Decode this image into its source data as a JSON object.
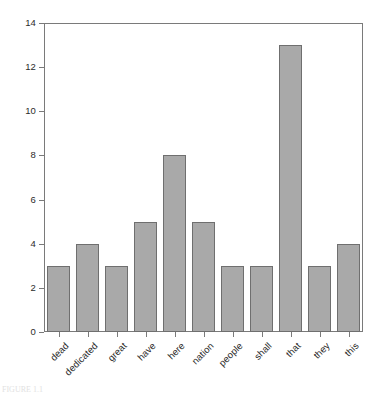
{
  "chart_data": {
    "type": "bar",
    "title": "",
    "subtitle": "",
    "xlabel": "",
    "ylabel": "",
    "categories": [
      "dead",
      "dedicated",
      "great",
      "have",
      "here",
      "nation",
      "people",
      "shall",
      "that",
      "they",
      "this"
    ],
    "values": [
      3,
      4,
      3,
      5,
      8,
      5,
      3,
      3,
      13,
      3,
      4
    ],
    "ylim": [
      0,
      14
    ],
    "yticks": [
      0,
      2,
      4,
      6,
      8,
      10,
      12,
      14
    ],
    "ytick_labels": [
      "0",
      "2",
      "4",
      "6",
      "8",
      "10",
      "12",
      "14"
    ],
    "grid": false,
    "legend": null,
    "legend_position": "none",
    "bar_fill_color": "#a9a9a9",
    "bar_edge_color": "#6f6f6f",
    "axis_color": "#7a7a7a",
    "text_color": "#2b2b2b",
    "background_color": "#ffffff",
    "xtick_label_rotation": 45
  },
  "caption": {
    "clipped_text": "FIGURE 1.1"
  }
}
